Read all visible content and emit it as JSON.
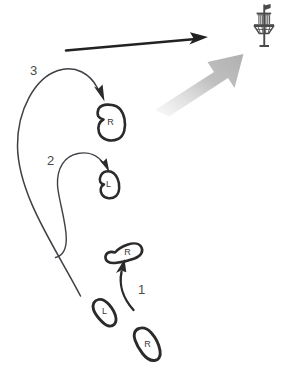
{
  "diagram": {
    "background_color": "#ffffff",
    "ink_color": "#2b2b2b",
    "curve_color": "#3f3f46",
    "gray_arrow_color": "#b3b3b3",
    "label_color": "#4a4a4a"
  },
  "target": {
    "name": "disc-golf-basket",
    "description": "Disc golf basket with flag",
    "color": "#4a4a4a"
  },
  "direction_arrow": {
    "name": "throw-direction-arrow",
    "color": "#222222",
    "description": "Straight black arrow pointing right toward target"
  },
  "flight_arrow": {
    "name": "disc-flight-arrow",
    "color": "#b3b3b3",
    "description": "Gray gradient arrow angled up and right toward basket"
  },
  "footprints": [
    {
      "id": "start-right",
      "label": "R",
      "foot": "right",
      "order": 0,
      "position": "bottom-right",
      "shape": "bean-vertical"
    },
    {
      "id": "start-left",
      "label": "L",
      "foot": "left",
      "order": 0,
      "position": "bottom-left",
      "shape": "bean-vertical"
    },
    {
      "id": "step1-right",
      "label": "R",
      "foot": "right",
      "order": 1,
      "position": "middle",
      "shape": "bean-angled"
    },
    {
      "id": "step2-left",
      "label": "L",
      "foot": "left",
      "order": 2,
      "position": "upper-middle",
      "shape": "blob-small"
    },
    {
      "id": "step3-right",
      "label": "R",
      "foot": "right",
      "order": 3,
      "position": "upper",
      "shape": "blob-large"
    }
  ],
  "steps": [
    {
      "number": "1",
      "name": "step-1",
      "from": "start-right",
      "to": "step1-right",
      "description": "Short curved arrow upward from rear right foot to planted right foot"
    },
    {
      "number": "2",
      "name": "step-2",
      "from": "step1-right",
      "to": "step2-left",
      "description": "Curved arrow looping left then up-right to left foot"
    },
    {
      "number": "3",
      "name": "step-3",
      "from": "start-left",
      "to": "step3-right",
      "description": "Long sweeping curved arrow up the left side to the final right foot"
    }
  ]
}
